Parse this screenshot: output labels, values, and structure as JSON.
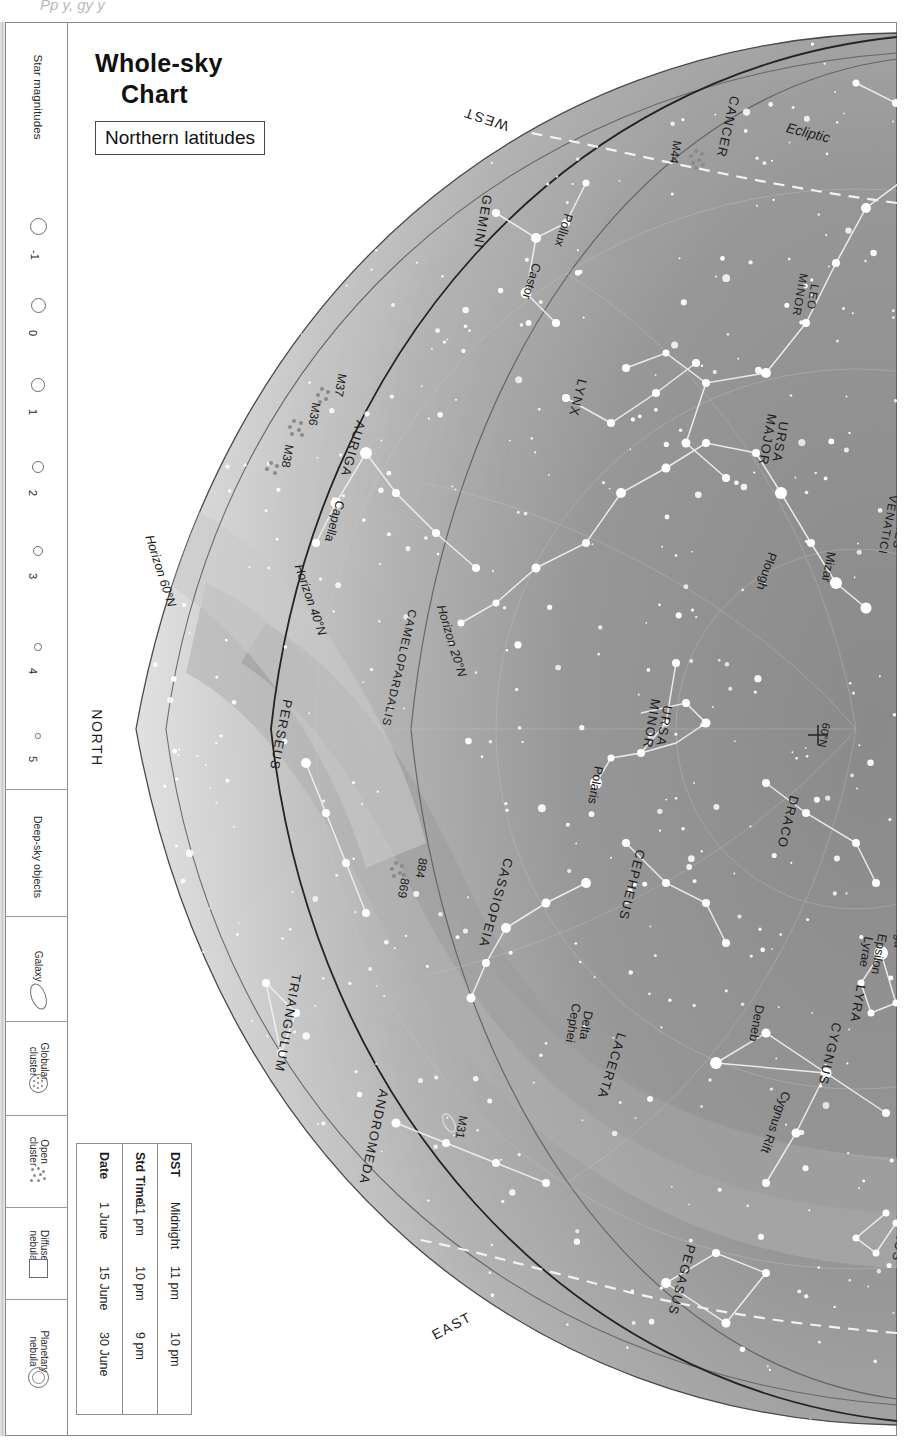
{
  "topclip_text": "Pp y, gy y",
  "title": {
    "line1": "Whole-sky",
    "line2": "Chart",
    "subtitle": "Northern latitudes"
  },
  "legend": {
    "magnitudes_label": "Star magnitudes",
    "magnitudes": [
      {
        "value": "-1",
        "size": 15
      },
      {
        "value": "0",
        "size": 13
      },
      {
        "value": "1",
        "size": 11.5
      },
      {
        "value": "2",
        "size": 10
      },
      {
        "value": "3",
        "size": 8
      },
      {
        "value": "4",
        "size": 5.5
      },
      {
        "value": "5",
        "size": 3.5
      }
    ],
    "deepsky_label": "Deep-sky objects",
    "deepsky": [
      {
        "name": "Galaxy",
        "icon": "galaxy-icon"
      },
      {
        "name": "Globular\ncluster",
        "icon": "globular-cluster-icon"
      },
      {
        "name": "Open\ncluster",
        "icon": "open-cluster-icon"
      },
      {
        "name": "Diffuse\nnebula",
        "icon": "diffuse-nebula-icon"
      },
      {
        "name": "Planetary\nnebula",
        "icon": "planetary-nebula-icon"
      }
    ]
  },
  "date_table": {
    "headers": [
      "Date",
      "Std Time",
      "DST"
    ],
    "rows": [
      [
        "1 June",
        "11 pm",
        "Midnight"
      ],
      [
        "15 June",
        "10 pm",
        "11 pm"
      ],
      [
        "30 June",
        "9 pm",
        "10 pm"
      ]
    ]
  },
  "map": {
    "compass": [
      {
        "label": "WEST",
        "x": 420,
        "y": 96,
        "rot": 198
      },
      {
        "label": "NORTH",
        "x": 30,
        "y": 715,
        "rot": 90
      },
      {
        "label": "EAST",
        "x": 386,
        "y": 1303,
        "rot": -28
      }
    ],
    "horizons": [
      {
        "label": "Horizon 60°N",
        "x": 94,
        "y": 548,
        "rot": 72
      },
      {
        "label": "Horizon 40°N",
        "x": 244,
        "y": 577,
        "rot": 71
      },
      {
        "label": "Horizon 20°N",
        "x": 385,
        "y": 618,
        "rot": 73
      }
    ],
    "ecliptic_label": {
      "label": "Ecliptic",
      "x": 742,
      "y": 110,
      "rot": 14
    },
    "gridlabels": [
      {
        "label": "60°N",
        "x": 758,
        "y": 712,
        "rot": 100
      },
      {
        "label": "40°N",
        "x": 879,
        "y": 725,
        "rot": 96
      }
    ],
    "constellations": [
      {
        "label": "CANCER",
        "x": 662,
        "y": 104,
        "rot": 103,
        "size": "const"
      },
      {
        "label": "LEO",
        "x": 850,
        "y": 196,
        "rot": 100,
        "size": "const"
      },
      {
        "label": "LEO\nMINOR",
        "x": 740,
        "y": 273,
        "rot": 100,
        "size": "constsm"
      },
      {
        "label": "GEMINI",
        "x": 417,
        "y": 199,
        "rot": 100,
        "size": "const"
      },
      {
        "label": "LYNX",
        "x": 512,
        "y": 375,
        "rot": 104,
        "size": "const"
      },
      {
        "label": "URSA\nMAJOR",
        "x": 708,
        "y": 418,
        "rot": 100,
        "size": "const"
      },
      {
        "label": "CANES\nVENATICI",
        "x": 828,
        "y": 503,
        "rot": 101,
        "size": "constsm"
      },
      {
        "label": "AURIGA",
        "x": 287,
        "y": 426,
        "rot": 106,
        "size": "const"
      },
      {
        "label": "CAMELOPARDALIS",
        "x": 333,
        "y": 645,
        "rot": 103,
        "size": "constsm"
      },
      {
        "label": "PERSEUS",
        "x": 215,
        "y": 712,
        "rot": 101,
        "size": "const"
      },
      {
        "label": "URSA\nMINOR",
        "x": 592,
        "y": 702,
        "rot": 100,
        "size": "const"
      },
      {
        "label": "DRACO",
        "x": 722,
        "y": 799,
        "rot": 104,
        "size": "const"
      },
      {
        "label": "CEPHEUS",
        "x": 566,
        "y": 862,
        "rot": 104,
        "size": "const"
      },
      {
        "label": "CASSIOPEIA",
        "x": 430,
        "y": 880,
        "rot": 106,
        "size": "const"
      },
      {
        "label": "LYRA",
        "x": 792,
        "y": 981,
        "rot": 100,
        "size": "const"
      },
      {
        "label": "CYGNUS",
        "x": 764,
        "y": 1031,
        "rot": 103,
        "size": "const"
      },
      {
        "label": "LACERTA",
        "x": 546,
        "y": 1043,
        "rot": 107,
        "size": "const"
      },
      {
        "label": "TRIANGULUM",
        "x": 222,
        "y": 1000,
        "rot": 100,
        "size": "const"
      },
      {
        "label": "ANDROMEDA",
        "x": 308,
        "y": 1114,
        "rot": 102,
        "size": "const"
      },
      {
        "label": "DELPHINUS",
        "x": 838,
        "y": 1196,
        "rot": 100,
        "size": "const"
      },
      {
        "label": "PEGASUS",
        "x": 616,
        "y": 1257,
        "rot": 105,
        "size": "const"
      },
      {
        "label": "EQUULEUS",
        "x": 846,
        "y": 1320,
        "rot": 100,
        "size": "const"
      }
    ],
    "stars": [
      {
        "label": "Regulus",
        "x": 857,
        "y": 92,
        "rot": 100
      },
      {
        "label": "Pollux",
        "x": 497,
        "y": 207,
        "rot": 107
      },
      {
        "label": "Castor",
        "x": 465,
        "y": 258,
        "rot": 107
      },
      {
        "label": "Capella",
        "x": 268,
        "y": 498,
        "rot": 106
      },
      {
        "label": "Plough",
        "x": 700,
        "y": 548,
        "rot": 108
      },
      {
        "label": "Mizar",
        "x": 762,
        "y": 544,
        "rot": 100
      },
      {
        "label": "Polaris",
        "x": 529,
        "y": 762,
        "rot": 100
      },
      {
        "label": "Vega",
        "x": 834,
        "y": 911,
        "rot": 100
      },
      {
        "label": "Epsilon\nLyrae",
        "x": 806,
        "y": 930,
        "rot": 100
      },
      {
        "label": "Deneb",
        "x": 690,
        "y": 1000,
        "rot": 100
      },
      {
        "label": "Delta\nCephei",
        "x": 513,
        "y": 1001,
        "rot": 100
      },
      {
        "label": "Albireo",
        "x": 874,
        "y": 1079,
        "rot": 100
      },
      {
        "label": "Cygnus Rift",
        "x": 709,
        "y": 1099,
        "rot": 110
      }
    ],
    "deepsky": [
      {
        "label": "M44",
        "x": 609,
        "y": 129,
        "rot": 100
      },
      {
        "label": "M37",
        "x": 274,
        "y": 362,
        "rot": 100
      },
      {
        "label": "M36",
        "x": 248,
        "y": 391,
        "rot": 100
      },
      {
        "label": "M38",
        "x": 221,
        "y": 433,
        "rot": 100
      },
      {
        "label": "884",
        "x": 355,
        "y": 845,
        "rot": 100
      },
      {
        "label": "869",
        "x": 337,
        "y": 865,
        "rot": 100
      },
      {
        "label": "M31",
        "x": 395,
        "y": 1104,
        "rot": 100
      },
      {
        "label": "M27",
        "x": 866,
        "y": 1147,
        "rot": 100
      }
    ]
  },
  "colors": {
    "sky_dark": "#8d8d8d",
    "sky_mid": "#b2b2b2",
    "sky_light": "#dcdcdc",
    "milkyway": "#a1a1a1",
    "star": "#ffffff",
    "horizon_line": "#2b2b2b",
    "frame": "#8a8a8a"
  }
}
